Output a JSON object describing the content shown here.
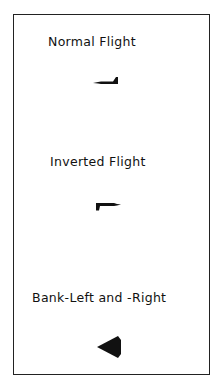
{
  "panels": [
    {
      "label": "Normal Flight",
      "icon": "aircraft-side-view-icon"
    },
    {
      "label": "Inverted Flight",
      "icon": "aircraft-inverted-side-view-icon"
    },
    {
      "label": "Bank-Left and -Right",
      "icon": "aircraft-bank-view-icon"
    }
  ],
  "colors": {
    "ink": "#111111",
    "background": "#ffffff",
    "border": "#222222"
  }
}
